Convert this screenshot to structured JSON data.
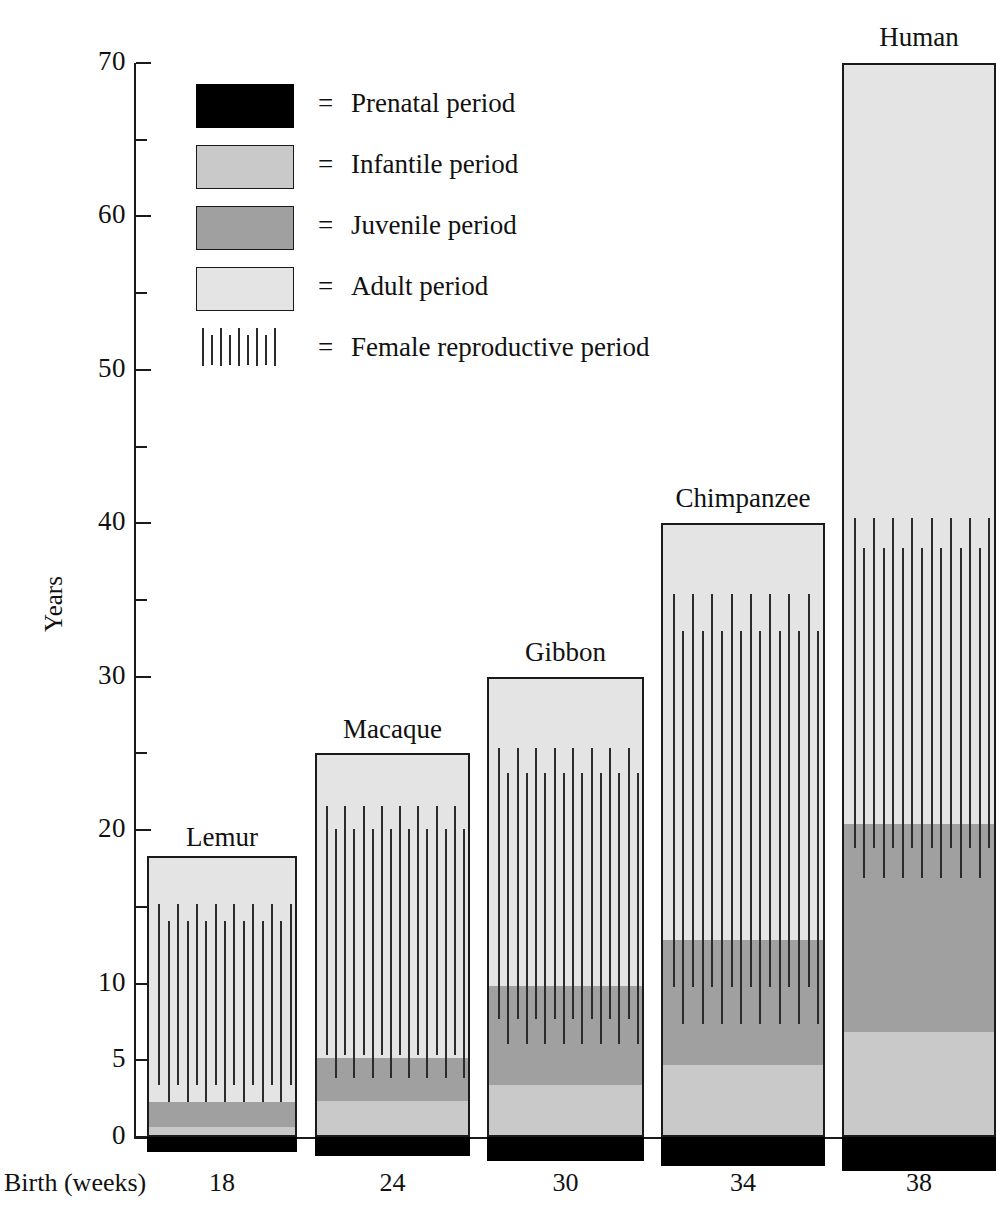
{
  "chart_data": {
    "type": "bar",
    "title": "",
    "xlabel": "Birth (weeks)",
    "ylabel": "Years",
    "ylim": [
      0,
      70
    ],
    "ytick_major": [
      0,
      10,
      20,
      30,
      40,
      50,
      60,
      70
    ],
    "ytick_major_labels": [
      "0",
      "10",
      "20",
      "30",
      "40",
      "50",
      "60",
      "70"
    ],
    "ytick_extra": [
      5
    ],
    "ytick_extra_labels": [
      "5"
    ],
    "ytick_minor": [
      15,
      25,
      35,
      45,
      55,
      65
    ],
    "grid": false,
    "legend_position": "upper-left-inset",
    "categories": [
      "Lemur",
      "Macaque",
      "Gibbon",
      "Chimpanzee",
      "Human"
    ],
    "xtick_labels": [
      "18",
      "24",
      "30",
      "34",
      "38"
    ],
    "series": [
      {
        "name": "Prenatal period",
        "color": "#000000",
        "units": "weeks",
        "values": [
          18,
          24,
          30,
          34,
          38
        ]
      },
      {
        "name": "Infantile period",
        "color": "#c9c9c9",
        "units": "years",
        "values": [
          0.8,
          2.5,
          3.5,
          4.8,
          7.0
        ]
      },
      {
        "name": "Juvenile period",
        "color": "#a0a0a0",
        "units": "years",
        "values": [
          1.6,
          2.8,
          6.5,
          8.2,
          13.5
        ]
      },
      {
        "name": "Adult period",
        "color": "#e4e4e4",
        "units": "years",
        "values": [
          15.9,
          19.7,
          20.0,
          27.0,
          49.5
        ]
      }
    ],
    "lifespan_totals": [
      18.3,
      25,
      30,
      40,
      70
    ],
    "female_reproductive_period": {
      "name": "Female reproductive period",
      "lemur": {
        "start": 2.4,
        "end": 15.3
      },
      "macaque": {
        "start": 4.0,
        "end": 21.7
      },
      "gibbon": {
        "start": 6.2,
        "end": 25.5
      },
      "chimpanzee": {
        "start": 7.5,
        "end": 35.5
      },
      "human": {
        "start": 17.0,
        "end": 40.5
      }
    }
  },
  "axis": {
    "ylabel": "Years",
    "xlabel": "Birth (weeks)"
  },
  "legend": {
    "equals": "=",
    "items": [
      {
        "swatch": "prenatal",
        "label": "Prenatal period"
      },
      {
        "swatch": "infantile",
        "label": "Infantile period"
      },
      {
        "swatch": "juvenile",
        "label": "Juvenile period"
      },
      {
        "swatch": "adult",
        "label": "Adult period"
      },
      {
        "swatch": "repro",
        "label": "Female reproductive period"
      }
    ]
  },
  "colors": {
    "prenatal": "#000000",
    "infantile": "#c9c9c9",
    "juvenile": "#a0a0a0",
    "adult": "#e4e4e4",
    "line": "#1a1a1a"
  }
}
